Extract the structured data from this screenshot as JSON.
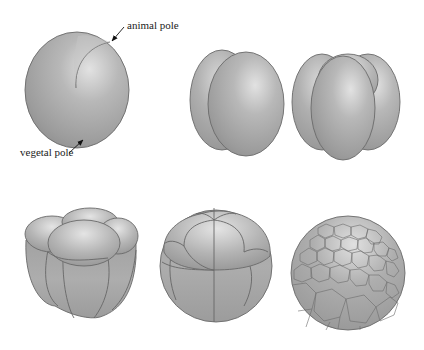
{
  "figure": {
    "labels": {
      "animal_pole": "animal pole",
      "vegetal_pole": "vegetal pole"
    },
    "stages": [
      {
        "id": "zygote",
        "cells": 1
      },
      {
        "id": "two-cell",
        "cells": 2
      },
      {
        "id": "four-cell",
        "cells": 4
      },
      {
        "id": "eight-cell",
        "cells": 8
      },
      {
        "id": "sixteen-cell",
        "cells": 16
      },
      {
        "id": "blastula",
        "cells": "many"
      }
    ],
    "colors": {
      "cell_light": "#d4d4d4",
      "cell_mid": "#a8a8a8",
      "cell_dark": "#8a8a8a",
      "outline": "#6a6a6a",
      "background": "#ffffff",
      "text": "#222222"
    }
  }
}
